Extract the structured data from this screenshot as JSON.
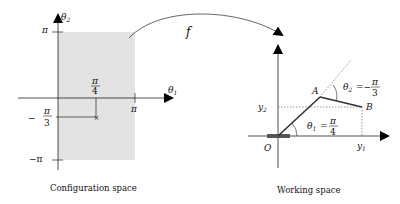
{
  "diagram": {
    "mapping_label": "f",
    "config_space": {
      "caption": "Configuration space",
      "axis_x_label": "θ",
      "axis_x_sub": "1",
      "axis_y_label": "θ",
      "axis_y_sub": "2",
      "tick_pi_top": "π",
      "tick_neg_pi": "−π",
      "tick_pi_right": "π",
      "point_x_num": "π",
      "point_x_den": "4",
      "point_y_sign": "−",
      "point_y_num": "π",
      "point_y_den": "3",
      "region_color": "#e3e3e3"
    },
    "working_space": {
      "caption": "Working space",
      "origin_label": "O",
      "joint_a_label": "A",
      "end_b_label": "B",
      "y1_label": "y",
      "y1_sub": "1",
      "y2_label": "y",
      "y2_sub": "2",
      "theta1_label": "θ",
      "theta1_sub": "1",
      "theta1_eq": "=",
      "theta1_num": "π",
      "theta1_den": "4",
      "theta2_label": "θ",
      "theta2_sub": "2",
      "theta2_eq": "=−",
      "theta2_num": "π",
      "theta2_den": "3",
      "link_color": "#333333",
      "base_color": "#555555"
    }
  }
}
